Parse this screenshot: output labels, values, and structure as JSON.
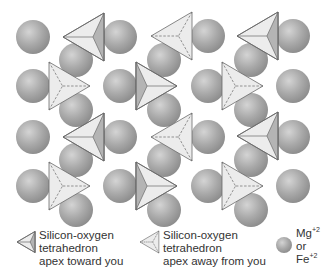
{
  "diagram": {
    "colors": {
      "background": "#ffffff",
      "sphere_light": "#d4d4d4",
      "sphere_mid": "#a9a9a9",
      "sphere_dark": "#8a8a8a",
      "tetra_face_light": "#ececec",
      "tetra_face_dark": "#b4b4b4",
      "tetra_edge": "#6a6a6a"
    },
    "spheres": [
      {
        "x": 33,
        "y": 37
      },
      {
        "x": 120,
        "y": 37
      },
      {
        "x": 208,
        "y": 36
      },
      {
        "x": 293,
        "y": 36
      },
      {
        "x": 76,
        "y": 60
      },
      {
        "x": 164,
        "y": 60
      },
      {
        "x": 251,
        "y": 60
      },
      {
        "x": 33,
        "y": 86
      },
      {
        "x": 120,
        "y": 86
      },
      {
        "x": 208,
        "y": 86
      },
      {
        "x": 293,
        "y": 86
      },
      {
        "x": 76,
        "y": 110
      },
      {
        "x": 164,
        "y": 110
      },
      {
        "x": 251,
        "y": 110
      },
      {
        "x": 33,
        "y": 137
      },
      {
        "x": 120,
        "y": 137
      },
      {
        "x": 208,
        "y": 137
      },
      {
        "x": 293,
        "y": 137
      },
      {
        "x": 76,
        "y": 160
      },
      {
        "x": 164,
        "y": 160
      },
      {
        "x": 251,
        "y": 160
      },
      {
        "x": 33,
        "y": 186
      },
      {
        "x": 120,
        "y": 186
      },
      {
        "x": 208,
        "y": 186
      },
      {
        "x": 293,
        "y": 186
      },
      {
        "x": 76,
        "y": 210
      },
      {
        "x": 164,
        "y": 210
      },
      {
        "x": 251,
        "y": 210
      }
    ],
    "sphere_radius": 17,
    "tetrahedra": [
      {
        "type": "toward",
        "dir": "left",
        "x": 63,
        "y": 37
      },
      {
        "type": "away",
        "dir": "left",
        "x": 151,
        "y": 36
      },
      {
        "type": "toward",
        "dir": "left",
        "x": 237,
        "y": 36
      },
      {
        "type": "away",
        "dir": "right",
        "x": 90,
        "y": 86
      },
      {
        "type": "toward",
        "dir": "right",
        "x": 177,
        "y": 86
      },
      {
        "type": "away",
        "dir": "right",
        "x": 263,
        "y": 86
      },
      {
        "type": "toward",
        "dir": "left",
        "x": 63,
        "y": 137
      },
      {
        "type": "away",
        "dir": "left",
        "x": 151,
        "y": 137
      },
      {
        "type": "toward",
        "dir": "left",
        "x": 237,
        "y": 136
      },
      {
        "type": "away",
        "dir": "right",
        "x": 90,
        "y": 186
      },
      {
        "type": "toward",
        "dir": "right",
        "x": 177,
        "y": 186
      },
      {
        "type": "away",
        "dir": "right",
        "x": 263,
        "y": 186
      }
    ]
  },
  "legend": {
    "toward": {
      "icon": "tetrahedron-toward-icon",
      "line1": "Silicon-oxygen",
      "line2": "tetrahedron",
      "line3": "apex toward you"
    },
    "away": {
      "icon": "tetrahedron-away-icon",
      "line1": "Silicon-oxygen",
      "line2": "tetrahedron",
      "line3": "apex away from you"
    },
    "cation": {
      "icon": "sphere-icon",
      "line1": "Mg",
      "line1_sup": "+2",
      "line2": "or",
      "line3": "Fe",
      "line3_sup": "+2"
    }
  }
}
